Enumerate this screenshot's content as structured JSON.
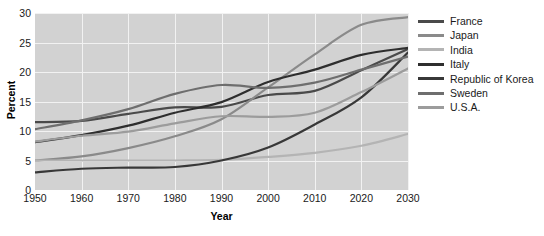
{
  "chart_data": {
    "type": "line",
    "title": "",
    "xlabel": "Year",
    "ylabel": "Percent",
    "xlim": [
      1950,
      2030
    ],
    "ylim": [
      0,
      30
    ],
    "xticks": [
      1950,
      1960,
      1970,
      1980,
      1990,
      2000,
      2010,
      2020,
      2030
    ],
    "yticks": [
      0,
      5,
      10,
      15,
      20,
      25,
      30
    ],
    "grid": true,
    "legend_position": "right",
    "plot_background": "#d2d2d2",
    "gridline_color": "#f2f2f2",
    "x": [
      1950,
      1960,
      1970,
      1980,
      1990,
      2000,
      2010,
      2020,
      2030
    ],
    "series": [
      {
        "name": "France",
        "color": "#4a4a4a",
        "values": [
          11.5,
          11.7,
          12.9,
          14.0,
          14.1,
          16.1,
          16.8,
          20.3,
          23.9
        ]
      },
      {
        "name": "Japan",
        "color": "#8a8a8a",
        "values": [
          5.0,
          5.7,
          7.1,
          9.1,
          12.0,
          17.4,
          23.0,
          28.0,
          29.3
        ]
      },
      {
        "name": "India",
        "color": "#b4b4b4",
        "values": [
          5.0,
          5.0,
          5.0,
          5.0,
          5.1,
          5.6,
          6.3,
          7.5,
          9.5
        ]
      },
      {
        "name": "Italy",
        "color": "#2e2e2e",
        "values": [
          8.1,
          9.3,
          10.9,
          13.1,
          14.9,
          18.3,
          20.4,
          22.9,
          24.1
        ]
      },
      {
        "name": "Republic of Korea",
        "color": "#383838",
        "values": [
          3.0,
          3.6,
          3.8,
          3.9,
          5.0,
          7.2,
          11.1,
          15.7,
          23.3
        ]
      },
      {
        "name": "Sweden",
        "color": "#6e6e6e",
        "values": [
          10.3,
          11.8,
          13.7,
          16.3,
          17.8,
          17.3,
          18.2,
          20.4,
          22.6
        ]
      },
      {
        "name": "U.S.A.",
        "color": "#9c9c9c",
        "values": [
          8.2,
          9.2,
          9.9,
          11.3,
          12.5,
          12.4,
          13.1,
          16.6,
          20.6
        ]
      }
    ]
  },
  "legend": {
    "items": [
      {
        "label": "France"
      },
      {
        "label": "Japan"
      },
      {
        "label": "India"
      },
      {
        "label": "Italy"
      },
      {
        "label": "Republic of Korea"
      },
      {
        "label": "Sweden"
      },
      {
        "label": "U.S.A."
      }
    ]
  }
}
